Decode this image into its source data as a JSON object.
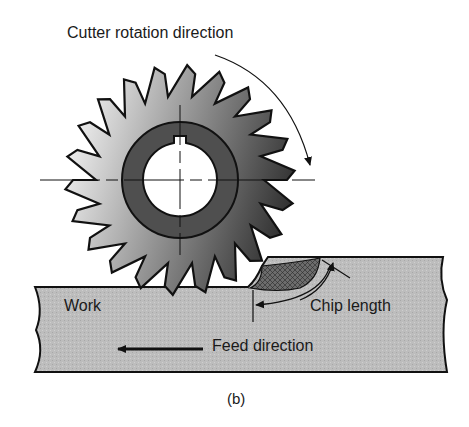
{
  "figure": {
    "caption": "(b)",
    "labels": {
      "cutter_rotation": "Cutter rotation direction",
      "work": "Work",
      "chip_length": "Chip length",
      "feed_direction": "Feed direction"
    },
    "colors": {
      "outline": "#111111",
      "work_fill": "#b9b9b9",
      "hub_fill": "#5a5a5a",
      "cutter_light": "#f2f2f2",
      "cutter_dark": "#3a3a3a",
      "chip_fill": "#6a6a6a"
    },
    "cutter": {
      "teeth": 22
    }
  }
}
